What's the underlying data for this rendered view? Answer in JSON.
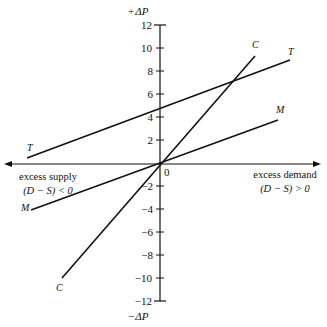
{
  "diagram": {
    "y_axis": {
      "top_label_prefix": "+",
      "top_label_var": "ΔP",
      "bottom_label_prefix": "−",
      "bottom_label_var": "ΔP",
      "ticks": [
        {
          "value": 12,
          "label": "12"
        },
        {
          "value": 10,
          "label": "10"
        },
        {
          "value": 8,
          "label": "8"
        },
        {
          "value": 6,
          "label": "6"
        },
        {
          "value": 4,
          "label": "4"
        },
        {
          "value": 2,
          "label": "2"
        },
        {
          "value": -2,
          "label": "−2"
        },
        {
          "value": -4,
          "label": "−4"
        },
        {
          "value": -6,
          "label": "−6"
        },
        {
          "value": -8,
          "label": "−8"
        },
        {
          "value": -10,
          "label": "−10"
        },
        {
          "value": -12,
          "label": "−12"
        }
      ],
      "origin_label": "0"
    },
    "x_axis": {
      "left_label_line1": "excess supply",
      "left_label_line2": "(D − S) < 0",
      "right_label_line1": "excess demand",
      "right_label_line2": "(D − S) > 0"
    },
    "lines": [
      {
        "name": "T",
        "label": "T",
        "description": "upward sloping line with positive intercept ~4.6"
      },
      {
        "name": "C",
        "label": "C",
        "description": "steep line through origin"
      },
      {
        "name": "M",
        "label": "M",
        "description": "shallow line through origin"
      }
    ]
  }
}
